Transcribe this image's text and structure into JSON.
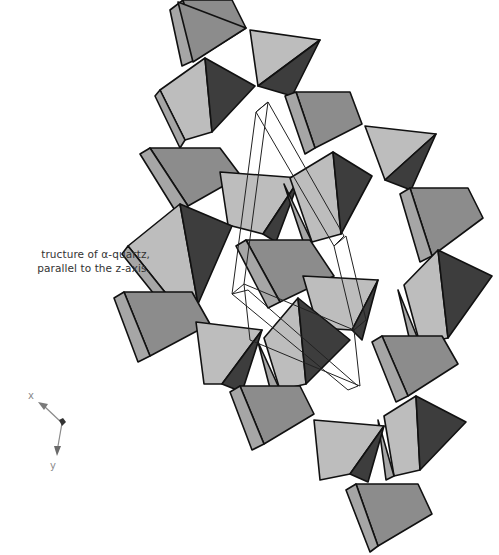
{
  "caption": {
    "line1": "tructure of α-quartz,",
    "line2": "parallel to the z-axis."
  },
  "axes": {
    "x_label": "x",
    "y_label": "y"
  },
  "colors": {
    "light": "#bdbdbd",
    "mid": "#8c8c8c",
    "dark": "#3d3d3d",
    "side": "#a6a6a6",
    "edge": "#111111",
    "outline_box": "#222222",
    "axis_arrow": "#8a8a8a",
    "axis_center": "#333333"
  },
  "tetrahedra": [
    {
      "id": "t1",
      "faces": [
        {
          "shade": "mid",
          "pts": "183,0 232,0 246,28 195,60"
        },
        {
          "shade": "side",
          "pts": "170,10 183,0 195,60 182,66"
        }
      ]
    },
    {
      "id": "t2",
      "faces": [
        {
          "shade": "mid",
          "pts": "178,2 246,28 193,62"
        },
        {
          "shade": "light",
          "pts": "250,30 320,40 258,86"
        },
        {
          "shade": "dark",
          "pts": "320,40 258,86 292,96"
        }
      ]
    },
    {
      "id": "t3",
      "faces": [
        {
          "shade": "light",
          "pts": "160,90 205,58 212,132 185,140"
        },
        {
          "shade": "dark",
          "pts": "205,58 255,86 212,132"
        },
        {
          "shade": "side",
          "pts": "160,90 185,140 180,148 155,96"
        }
      ]
    },
    {
      "id": "t4",
      "faces": [
        {
          "shade": "mid",
          "pts": "296,92 350,92 362,124 315,148"
        },
        {
          "shade": "side",
          "pts": "285,96 296,92 315,148 305,154"
        },
        {
          "shade": "light",
          "pts": "365,126 436,134 385,180"
        },
        {
          "shade": "dark",
          "pts": "436,134 385,180 411,190"
        }
      ]
    },
    {
      "id": "t5",
      "faces": [
        {
          "shade": "mid",
          "pts": "150,148 220,148 241,176 188,206"
        },
        {
          "shade": "side",
          "pts": "140,154 150,148 188,206 176,212"
        }
      ]
    },
    {
      "id": "t6",
      "faces": [
        {
          "shade": "light",
          "pts": "220,172 300,178 263,234 228,225"
        },
        {
          "shade": "dark",
          "pts": "300,178 263,234 276,242"
        }
      ]
    },
    {
      "id": "t7",
      "faces": [
        {
          "shade": "light",
          "pts": "290,178 333,152 341,234 312,242"
        },
        {
          "shade": "dark",
          "pts": "333,152 372,176 341,234"
        },
        {
          "shade": "side",
          "pts": "284,184 312,242 306,250"
        }
      ]
    },
    {
      "id": "t8",
      "faces": [
        {
          "shade": "mid",
          "pts": "410,188 468,188 483,218 432,256"
        },
        {
          "shade": "side",
          "pts": "400,194 410,188 432,256 420,262"
        }
      ]
    },
    {
      "id": "t9",
      "faces": [
        {
          "shade": "light",
          "pts": "128,246 180,204 198,304 168,296"
        },
        {
          "shade": "dark",
          "pts": "180,204 232,226 198,304"
        },
        {
          "shade": "side",
          "pts": "128,246 168,296 162,304 122,254"
        }
      ]
    },
    {
      "id": "t10",
      "faces": [
        {
          "shade": "mid",
          "pts": "246,240 310,240 334,276 280,302"
        },
        {
          "shade": "side",
          "pts": "236,246 246,240 280,302 268,308"
        }
      ]
    },
    {
      "id": "t11",
      "faces": [
        {
          "shade": "light",
          "pts": "404,285 438,250 448,338 420,344"
        },
        {
          "shade": "dark",
          "pts": "438,250 492,276 448,338"
        },
        {
          "shade": "side",
          "pts": "398,290 420,344 412,350"
        }
      ]
    },
    {
      "id": "t12",
      "faces": [
        {
          "shade": "light",
          "pts": "303,276 378,280 352,330 318,328"
        },
        {
          "shade": "dark",
          "pts": "378,280 352,330 362,340"
        }
      ]
    },
    {
      "id": "t13",
      "faces": [
        {
          "shade": "mid",
          "pts": "124,292 192,292 210,324 150,356"
        },
        {
          "shade": "side",
          "pts": "114,298 124,292 150,356 138,362"
        }
      ]
    },
    {
      "id": "t14",
      "faces": [
        {
          "shade": "light",
          "pts": "264,338 298,298 306,384 280,390"
        },
        {
          "shade": "dark",
          "pts": "298,298 350,340 306,384"
        },
        {
          "shade": "side",
          "pts": "258,342 280,390 272,396"
        }
      ]
    },
    {
      "id": "t15",
      "faces": [
        {
          "shade": "light",
          "pts": "196,322 262,330 222,384 204,384"
        },
        {
          "shade": "dark",
          "pts": "262,330 222,384 242,392"
        }
      ]
    },
    {
      "id": "t16",
      "faces": [
        {
          "shade": "mid",
          "pts": "382,336 442,336 458,364 408,396"
        },
        {
          "shade": "side",
          "pts": "372,342 382,336 408,396 396,402"
        }
      ]
    },
    {
      "id": "t17",
      "faces": [
        {
          "shade": "mid",
          "pts": "240,386 300,386 314,414 264,444"
        },
        {
          "shade": "side",
          "pts": "230,392 240,386 264,444 252,450"
        }
      ]
    },
    {
      "id": "t18",
      "faces": [
        {
          "shade": "light",
          "pts": "384,416 416,396 420,470 394,476"
        },
        {
          "shade": "dark",
          "pts": "416,396 466,422 420,470"
        },
        {
          "shade": "side",
          "pts": "378,420 394,476 386,480"
        }
      ]
    },
    {
      "id": "t19",
      "faces": [
        {
          "shade": "light",
          "pts": "314,420 384,426 350,474 320,480"
        },
        {
          "shade": "dark",
          "pts": "384,426 350,474 368,482"
        }
      ]
    },
    {
      "id": "t20",
      "faces": [
        {
          "shade": "mid",
          "pts": "356,484 418,484 432,514 378,546"
        },
        {
          "shade": "side",
          "pts": "346,490 356,484 378,546 370,552"
        }
      ]
    }
  ],
  "unit_cell_outline": [
    "256,112 268,102 344,236 334,246",
    "232,294 256,112 268,102 244,284",
    "334,246 354,330 366,320 346,236",
    "244,284 354,330 360,386 250,340",
    "232,294 248,290 358,386 348,390"
  ]
}
